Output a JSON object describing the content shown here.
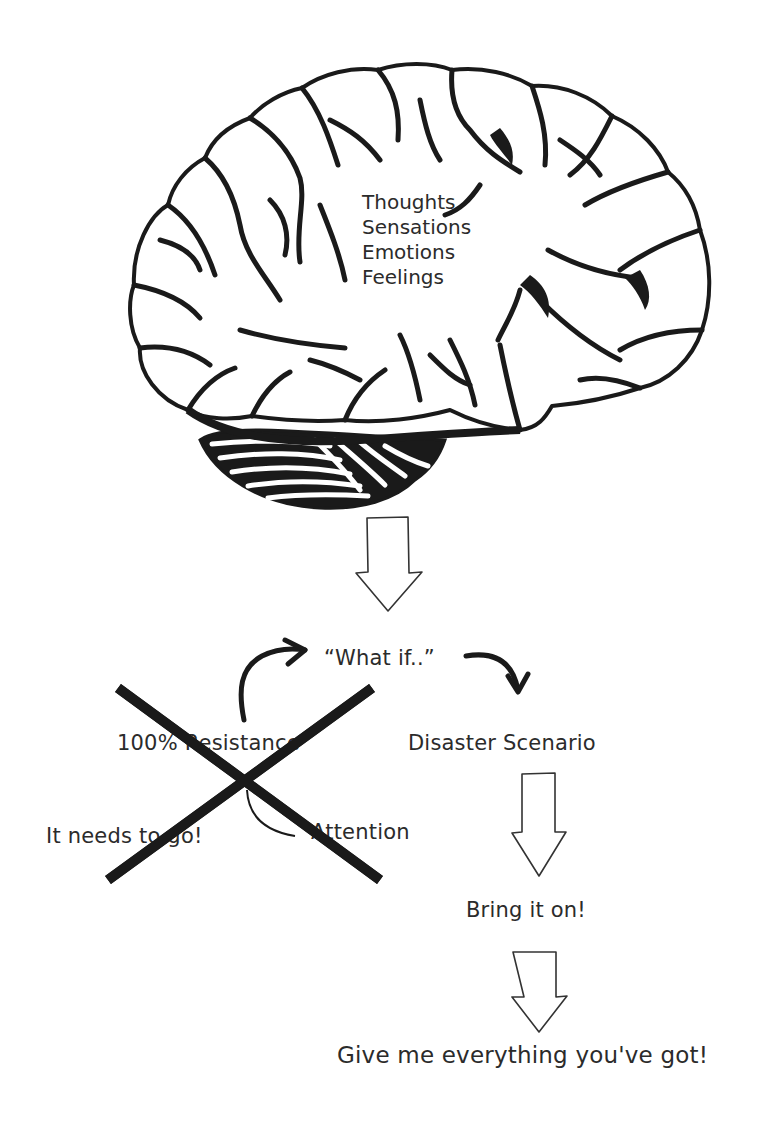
{
  "diagram": {
    "brain": {
      "icon": "brain-icon",
      "labels": [
        "Thoughts",
        "Sensations",
        "Emotions",
        "Feelings"
      ]
    },
    "nodes": {
      "what_if": "“What if..”",
      "resistance": "100% Resistance",
      "disaster": "Disaster Scenario",
      "needs_to_go": "It needs to go!",
      "attention": "Attention",
      "bring_it_on": "Bring it on!",
      "give_me": "Give me everything you've got!"
    },
    "arrows": [
      {
        "from": "brain",
        "to": "what_if",
        "style": "block-outline"
      },
      {
        "from": "resistance",
        "to": "what_if",
        "style": "curved-brush"
      },
      {
        "from": "what_if",
        "to": "disaster",
        "style": "curved-brush"
      },
      {
        "from": "resistance",
        "to": "attention",
        "style": "curved-thin"
      },
      {
        "from": "disaster",
        "to": "bring_it_on",
        "style": "block-outline"
      },
      {
        "from": "bring_it_on",
        "to": "give_me",
        "style": "block-outline"
      }
    ],
    "crossed_out_region": [
      "resistance",
      "needs_to_go"
    ],
    "colors": {
      "ink": "#1a1a1a",
      "text": "#2b2b2b",
      "background": "#ffffff"
    }
  }
}
